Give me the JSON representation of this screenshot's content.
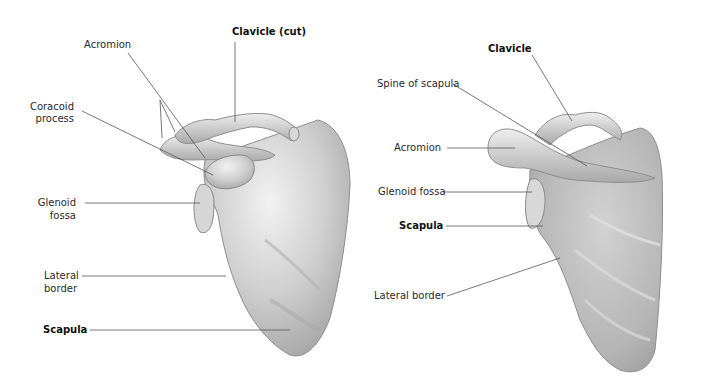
{
  "left_view": {
    "labels": {
      "clavicle": "Clavicle (cut)",
      "acromion": "Acromion",
      "coracoid_line1": "Coracoid",
      "coracoid_line2": "process",
      "glenoid_line1": "Glenoid",
      "glenoid_line2": "fossa",
      "lateral_line1": "Lateral",
      "lateral_line2": "border",
      "scapula": "Scapula"
    }
  },
  "right_view": {
    "labels": {
      "clavicle": "Clavicle",
      "spine": "Spine of scapula",
      "acromion": "Acromion",
      "glenoid": "Glenoid fossa",
      "scapula": "Scapula",
      "lateral": "Lateral border"
    }
  },
  "colors": {
    "bone_light": "#e6e6e6",
    "bone_mid": "#c8c8c8",
    "bone_dark": "#9a9a9a",
    "leader_line": "#555555"
  }
}
